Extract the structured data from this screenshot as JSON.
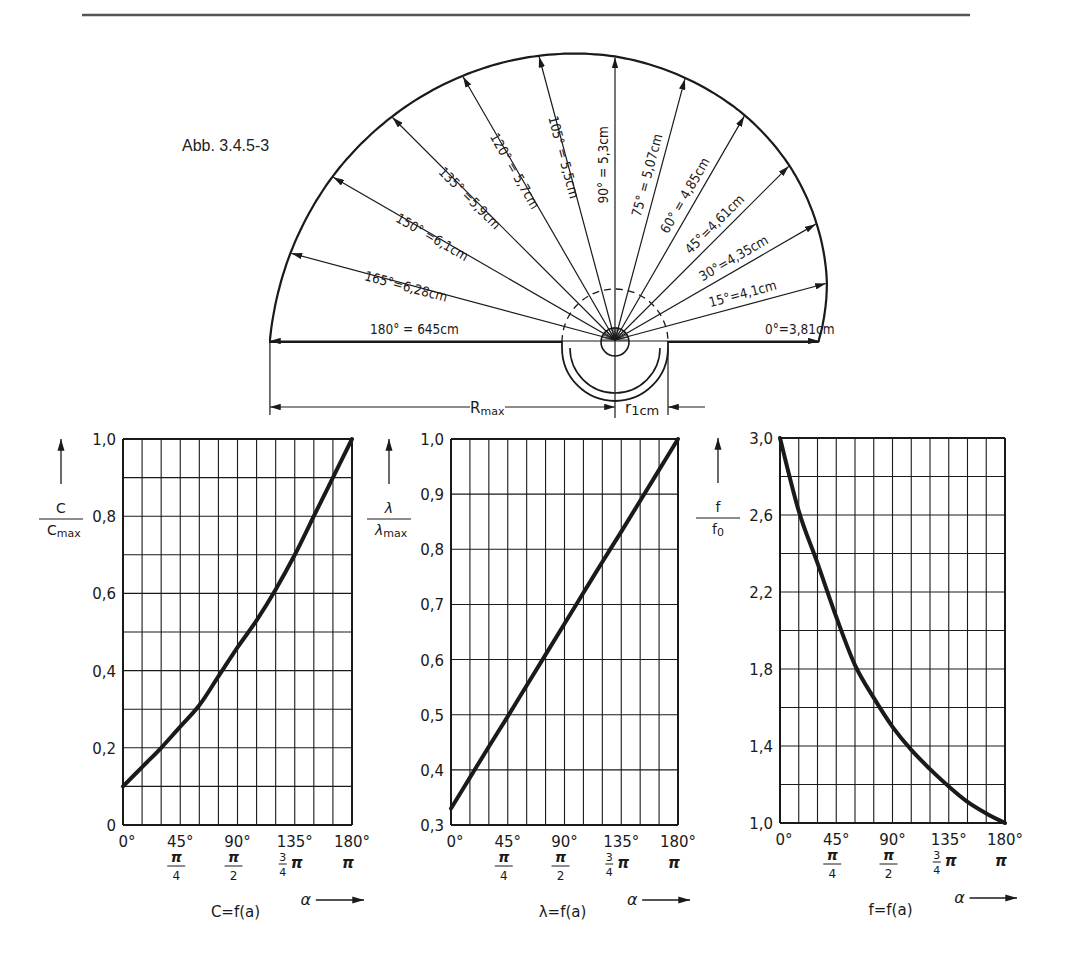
{
  "figure": {
    "caption": "Abb. 3.4.5-3",
    "rule_color": "#555555",
    "ink_color": "#1a1a1a"
  },
  "fan": {
    "center": [
      615,
      340
    ],
    "px_per_cm": 53.5,
    "rays": [
      {
        "angle": 0,
        "label": "0°=3,81cm",
        "r_cm": 3.81
      },
      {
        "angle": 15,
        "label": "15°=4,1cm",
        "r_cm": 4.1
      },
      {
        "angle": 30,
        "label": "30°=4,35cm",
        "r_cm": 4.35
      },
      {
        "angle": 45,
        "label": "45°=4,61cm",
        "r_cm": 4.61
      },
      {
        "angle": 60,
        "label": "60° = 4,85cm",
        "r_cm": 4.85
      },
      {
        "angle": 75,
        "label": "75° = 5,07cm",
        "r_cm": 5.07
      },
      {
        "angle": 90,
        "label": "90° = 5,3cm",
        "r_cm": 5.3
      },
      {
        "angle": 105,
        "label": "105° = 5,5cm",
        "r_cm": 5.5
      },
      {
        "angle": 120,
        "label": "120° = 5,7cm",
        "r_cm": 5.7
      },
      {
        "angle": 135,
        "label": "135° =5,9cm",
        "r_cm": 5.9
      },
      {
        "angle": 150,
        "label": "150° =6,1cm",
        "r_cm": 6.1
      },
      {
        "angle": 165,
        "label": "165°=6,28cm",
        "r_cm": 6.28
      },
      {
        "angle": 180,
        "label": "180° = 645cm",
        "r_cm": 6.45
      }
    ],
    "dimensions": {
      "rmax_label": "Rmax",
      "rmax_label_main": "R",
      "rmax_label_sub": "max",
      "r1_label_main": "r",
      "r1_label_sub": "1cm"
    }
  },
  "chart_data": [
    {
      "type": "line",
      "title": "C=f(a)",
      "ylabel": "C / Cmax",
      "ylabel_num": "C",
      "ylabel_den": "C",
      "ylabel_den_sub": "max",
      "xlabel": "α",
      "x": [
        0,
        15,
        30,
        45,
        60,
        75,
        90,
        105,
        120,
        135,
        150,
        165,
        180
      ],
      "values": [
        0.1,
        0.15,
        0.2,
        0.255,
        0.31,
        0.385,
        0.46,
        0.53,
        0.61,
        0.7,
        0.8,
        0.9,
        1.0
      ],
      "ylim": [
        0,
        1.0
      ],
      "y_grid_step": 0.1,
      "y_ticks": [
        0,
        0.2,
        0.4,
        0.6,
        0.8,
        1.0
      ],
      "y_tick_labels": [
        "0",
        "0,2",
        "0,4",
        "0,6",
        "0,8",
        "1,0"
      ],
      "x_ticks": [
        0,
        45,
        90,
        135,
        180
      ],
      "x_tick_labels": [
        "0°",
        "45°",
        "90°",
        "135°",
        "180°"
      ],
      "x_tick_rad_labels": [
        "π/4",
        "π/2",
        "3/4 π",
        "π"
      ],
      "grid": true,
      "box": [
        123,
        439,
        352,
        825
      ]
    },
    {
      "type": "line",
      "title": "λ=f(a)",
      "ylabel": "λ / λmax",
      "ylabel_num": "λ",
      "ylabel_den": "λ",
      "ylabel_den_sub": "max",
      "xlabel": "α",
      "x": [
        0,
        15,
        30,
        45,
        60,
        75,
        90,
        105,
        120,
        135,
        150,
        165,
        180
      ],
      "values": [
        0.33,
        0.386,
        0.442,
        0.497,
        0.553,
        0.609,
        0.665,
        0.721,
        0.777,
        0.832,
        0.888,
        0.944,
        1.0
      ],
      "ylim": [
        0.3,
        1.0
      ],
      "y_grid_step": 0.1,
      "y_ticks": [
        0.3,
        0.4,
        0.5,
        0.6,
        0.7,
        0.8,
        0.9,
        1.0
      ],
      "y_tick_labels": [
        "0,3",
        "0,4",
        "0,5",
        "0,6",
        "0,7",
        "0,8",
        "0,9",
        "1,0"
      ],
      "x_ticks": [
        0,
        45,
        90,
        135,
        180
      ],
      "x_tick_labels": [
        "0°",
        "45°",
        "90°",
        "135°",
        "180°"
      ],
      "x_tick_rad_labels": [
        "π/4",
        "π/2",
        "3/4 π",
        "π"
      ],
      "grid": true,
      "box": [
        451,
        439,
        678,
        825
      ]
    },
    {
      "type": "line",
      "title": "f=f(a)",
      "ylabel": "f / f0",
      "ylabel_num": "f",
      "ylabel_den": "f",
      "ylabel_den_sub": "0",
      "xlabel": "α",
      "x": [
        0,
        15,
        30,
        45,
        60,
        75,
        90,
        105,
        120,
        135,
        150,
        165,
        180
      ],
      "values": [
        3.0,
        2.62,
        2.35,
        2.07,
        1.82,
        1.65,
        1.5,
        1.38,
        1.28,
        1.19,
        1.11,
        1.05,
        1.0
      ],
      "ylim": [
        1.0,
        3.0
      ],
      "y_grid_step": 0.2,
      "y_ticks": [
        1.0,
        1.4,
        1.8,
        2.2,
        2.6,
        3.0
      ],
      "y_tick_labels": [
        "1,0",
        "1,4",
        "1,8",
        "2,2",
        "2,6",
        "3,0"
      ],
      "x_ticks": [
        0,
        45,
        90,
        135,
        180
      ],
      "x_tick_labels": [
        "0°",
        "45°",
        "90°",
        "135°",
        "180°"
      ],
      "x_tick_rad_labels": [
        "π/4",
        "π/2",
        "3/4 π",
        "π"
      ],
      "grid": true,
      "box": [
        780,
        438,
        1005,
        823
      ]
    }
  ]
}
